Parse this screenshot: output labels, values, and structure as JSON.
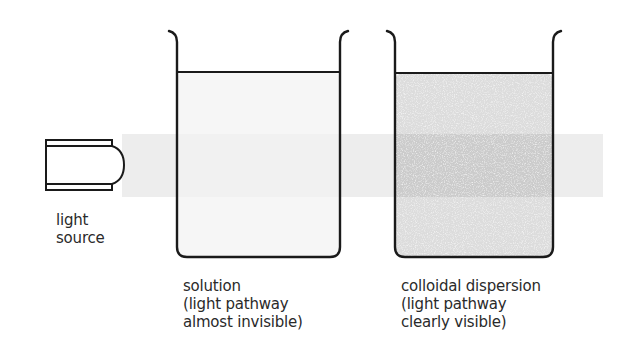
{
  "diagram": {
    "type": "tyndall-effect-comparison",
    "colors": {
      "outline": "#1a1a1a",
      "beam": "#ececec",
      "solution_liquid": "#f7f7f7",
      "colloid_liquid": "#dadada",
      "colloid_beam": "#cbcbcb",
      "text": "#2a2a2a"
    },
    "light_source": {
      "label_lines": [
        "light",
        "source"
      ]
    },
    "beakers": [
      {
        "id": "solution",
        "label_lines": [
          "solution",
          "(light pathway",
          "almost invisible)"
        ]
      },
      {
        "id": "colloid",
        "label_lines": [
          "colloidal dispersion",
          "(light pathway",
          "clearly visible)"
        ]
      }
    ]
  }
}
